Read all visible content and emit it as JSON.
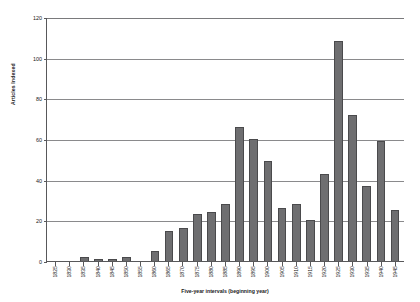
{
  "chart_data": {
    "type": "bar",
    "title": "",
    "xlabel": "Five-year intervals (beginning year)",
    "ylabel": "Articles Indexed",
    "ylim": [
      0,
      120
    ],
    "ytick_step": 20,
    "yticks": [
      0,
      20,
      40,
      60,
      80,
      100,
      120
    ],
    "grid": true,
    "legend": false,
    "bar_color": "#6e6e70",
    "bar_border_color": "#4a4a4c",
    "axis_color": "#58585a",
    "gridline_color": "#8a8a8c",
    "categories": [
      "1825",
      "1830",
      "1835",
      "1840",
      "1845",
      "1850",
      "1855",
      "1860",
      "1865",
      "1870",
      "1875",
      "1880",
      "1885",
      "1890",
      "1895",
      "1900",
      "1905",
      "1910",
      "1915",
      "1920",
      "1925",
      "1930",
      "1935",
      "1940",
      "1945"
    ],
    "values": [
      0,
      0,
      2,
      1,
      1,
      2,
      0,
      5,
      15,
      16,
      23,
      24,
      28,
      66,
      60,
      49,
      26,
      28,
      20,
      43,
      108,
      72,
      37,
      59,
      25
    ]
  }
}
